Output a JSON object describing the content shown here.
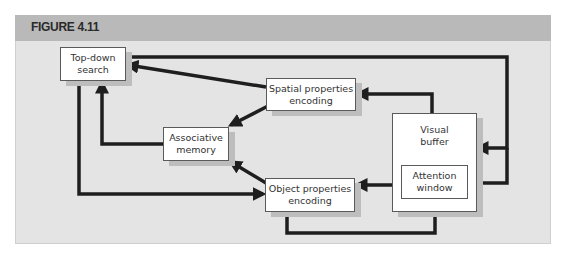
{
  "figure": {
    "title": "FIGURE 4.11",
    "colors": {
      "header": "#b9b9b9",
      "panel": "#e4e4e4",
      "arrow": "#1e1e1e",
      "box": "#ffffff"
    }
  },
  "nodes": {
    "top_down": "Top-down\nsearch",
    "spatial": "Spatial properties\nencoding",
    "associative": "Associative\nmemory",
    "object": "Object properties\nencoding",
    "visual_buffer": "Visual\nbuffer",
    "attention": "Attention\nwindow"
  },
  "edges": [
    {
      "from": "Top-down search",
      "to": "Visual buffer"
    },
    {
      "from": "Top-down search",
      "to": "Attention window"
    },
    {
      "from": "Top-down search",
      "to": "Object properties encoding"
    },
    {
      "from": "Spatial properties encoding",
      "to": "Top-down search"
    },
    {
      "from": "Spatial properties encoding",
      "to": "Associative memory"
    },
    {
      "from": "Associative memory",
      "to": "Top-down search"
    },
    {
      "from": "Object properties encoding",
      "to": "Associative memory"
    },
    {
      "from": "Object properties encoding",
      "to": "Attention window"
    },
    {
      "from": "Visual buffer",
      "to": "Spatial properties encoding"
    },
    {
      "from": "Attention window",
      "to": "Object properties encoding"
    }
  ]
}
